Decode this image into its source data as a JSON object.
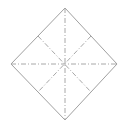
{
  "diagram": {
    "type": "fold-pattern",
    "shape": "diamond",
    "colors": {
      "outline": "#a0a0a0",
      "fold_lines": "#a8a8a8",
      "background": "#ffffff"
    },
    "vertices": {
      "top": [
        65,
        8
      ],
      "right": [
        117,
        64
      ],
      "bottom": [
        65,
        120
      ],
      "left": [
        11,
        64
      ]
    },
    "center": [
      64,
      64
    ],
    "fold_lines": [
      {
        "name": "vertical",
        "from": [
          65,
          8
        ],
        "to": [
          65,
          120
        ],
        "style": "dash-dot"
      },
      {
        "name": "horizontal",
        "from": [
          11,
          64
        ],
        "to": [
          117,
          64
        ],
        "style": "dash-dot"
      },
      {
        "name": "diagonal-ul-lr",
        "from": [
          38,
          36
        ],
        "to": [
          91,
          92
        ],
        "style": "dash-dot"
      },
      {
        "name": "diagonal-ur-ll",
        "from": [
          91,
          36
        ],
        "to": [
          38,
          92
        ],
        "style": "dash-dot"
      }
    ]
  }
}
